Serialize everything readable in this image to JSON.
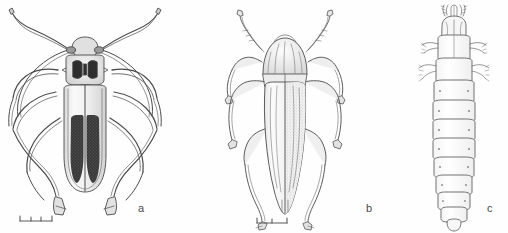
{
  "plate": {
    "background_color": "#fefefe",
    "ink_color": "#4a4a4a",
    "fill_light": "#f2f2f2",
    "fill_dark": "#3a3a3a",
    "figures": [
      {
        "key": "a",
        "label": "a",
        "icon": "longhorn-beetle-dorsal-icon",
        "subject": "longhorn beetle adult, dorsal view",
        "scale_bar": {
          "divisions": 3,
          "present": true
        }
      },
      {
        "key": "b",
        "label": "b",
        "icon": "jewel-beetle-dorsal-icon",
        "subject": "jewel beetle adult, dorsal view",
        "scale_bar": {
          "divisions": 2,
          "present": true
        }
      },
      {
        "key": "c",
        "label": "c",
        "icon": "beetle-larva-dorsal-icon",
        "subject": "beetle larva, dorsal view",
        "scale_bar": {
          "divisions": 0,
          "present": false
        }
      }
    ]
  }
}
